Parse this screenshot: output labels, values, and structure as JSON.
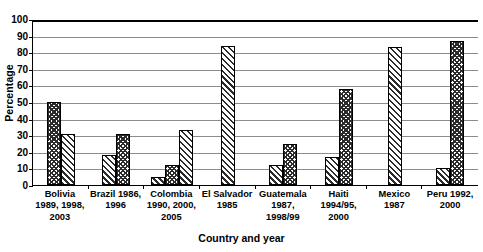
{
  "chart_data": {
    "type": "bar",
    "title": "",
    "xlabel": "Country and year",
    "ylabel": "Percentage",
    "ylim": [
      0,
      100
    ],
    "ytick_step": 10,
    "yticks": [
      100,
      90,
      80,
      70,
      60,
      50,
      40,
      30,
      20,
      10,
      0
    ],
    "grid": true,
    "legend": "none",
    "patterns": [
      "checker",
      "diagonal"
    ],
    "categories": [
      "Bolivia 1989, 1998, 2003",
      "Brazil 1986, 1996",
      "Colombia 1990, 2000, 2005",
      "El Salvador 1985",
      "Guatemala 1987, 1998/99",
      "Haiti 1994/95, 2000",
      "Mexico 1987",
      "Peru 1992, 2000"
    ],
    "groups": [
      {
        "category": "Bolivia 1989, 1998, 2003",
        "label_lines": [
          "Bolivia",
          "1989, 1998,",
          "2003"
        ],
        "bars": [
          {
            "value": 50,
            "pattern": "checker"
          },
          {
            "value": 31,
            "pattern": "diagonal"
          }
        ]
      },
      {
        "category": "Brazil 1986, 1996",
        "label_lines": [
          "Brazil 1986,",
          "1996"
        ],
        "bars": [
          {
            "value": 18,
            "pattern": "diagonal"
          },
          {
            "value": 31,
            "pattern": "checker"
          }
        ]
      },
      {
        "category": "Colombia 1990, 2000, 2005",
        "label_lines": [
          "Colombia",
          "1990, 2000,",
          "2005"
        ],
        "bars": [
          {
            "value": 5,
            "pattern": "diagonal"
          },
          {
            "value": 12,
            "pattern": "checker"
          },
          {
            "value": 33,
            "pattern": "diagonal"
          }
        ]
      },
      {
        "category": "El Salvador 1985",
        "label_lines": [
          "El Salvador",
          "1985"
        ],
        "bars": [
          {
            "value": 84,
            "pattern": "diagonal"
          }
        ]
      },
      {
        "category": "Guatemala 1987, 1998/99",
        "label_lines": [
          "Guatemala",
          "1987,",
          "1998/99"
        ],
        "bars": [
          {
            "value": 12,
            "pattern": "diagonal"
          },
          {
            "value": 25,
            "pattern": "checker"
          }
        ]
      },
      {
        "category": "Haiti 1994/95, 2000",
        "label_lines": [
          "Haiti",
          "1994/95,",
          "2000"
        ],
        "bars": [
          {
            "value": 17,
            "pattern": "diagonal"
          },
          {
            "value": 58,
            "pattern": "checker"
          }
        ]
      },
      {
        "category": "Mexico 1987",
        "label_lines": [
          "Mexico",
          "1987"
        ],
        "bars": [
          {
            "value": 83,
            "pattern": "diagonal"
          }
        ]
      },
      {
        "category": "Peru 1992, 2000",
        "label_lines": [
          "Peru 1992,",
          "2000"
        ],
        "bars": [
          {
            "value": 10,
            "pattern": "diagonal"
          },
          {
            "value": 87,
            "pattern": "checker"
          }
        ]
      }
    ]
  },
  "colors": {
    "axis": "#000000",
    "gridline": "#8c8c8c",
    "bar_border": "#000000",
    "bar_hatch": "#2b2b2b",
    "background": "#ffffff"
  }
}
